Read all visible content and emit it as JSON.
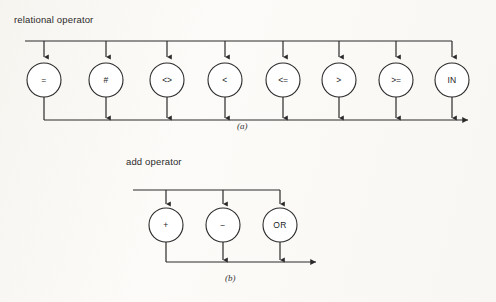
{
  "figure": {
    "background_color": "#fbfaf7",
    "stroke_color": "#2a2a2a",
    "node_fill": "#ffffff"
  },
  "diagrams": [
    {
      "id": "relational-operator",
      "title": "relational operator",
      "caption": "(a)",
      "node_count": 8,
      "nodes": [
        {
          "label": "=",
          "cx": 44,
          "cy": 80
        },
        {
          "label": "#",
          "cx": 106,
          "cy": 80
        },
        {
          "label": "<>",
          "cx": 167,
          "cy": 80
        },
        {
          "label": "<",
          "cx": 225,
          "cy": 80
        },
        {
          "label": "<=",
          "cx": 283,
          "cy": 80
        },
        {
          "label": ">",
          "cx": 339,
          "cy": 80
        },
        {
          "label": ">=",
          "cx": 396,
          "cy": 80
        },
        {
          "label": "IN",
          "cx": 452,
          "cy": 80
        }
      ],
      "top_rail_y": 41,
      "bottom_rail_y": 120,
      "top_rail_x1": 25,
      "top_rail_x2": 452,
      "bottom_rail_x1": 44,
      "bottom_rail_x2": 472,
      "node_radius": 17
    },
    {
      "id": "add-operator",
      "title": "add operator",
      "caption": "(b)",
      "node_count": 3,
      "nodes": [
        {
          "label": "+",
          "cx": 166,
          "cy": 225
        },
        {
          "label": "−",
          "cx": 223,
          "cy": 225
        },
        {
          "label": "OR",
          "cx": 280,
          "cy": 225
        }
      ],
      "top_rail_y": 190,
      "bottom_rail_y": 262,
      "top_rail_x1": 133,
      "top_rail_x2": 280,
      "bottom_rail_x1": 166,
      "bottom_rail_x2": 320,
      "node_radius": 17
    }
  ]
}
